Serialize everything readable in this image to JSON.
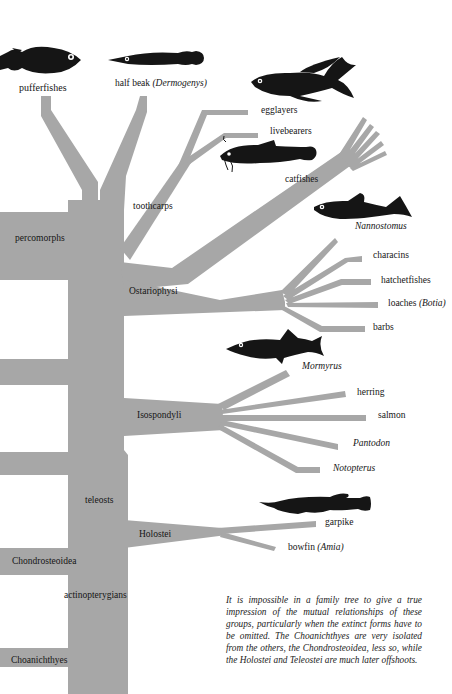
{
  "diagram": {
    "type": "phylogenetic-tree",
    "branch_color": "#a7a7a7",
    "fish_color": "#151515",
    "background": "#ffffff"
  },
  "labels": {
    "pufferfishes": "pufferfishes",
    "halfbeak": "half beak",
    "halfbeak_genus": "(Dermogenys)",
    "egglayers": "egglayers",
    "livebearers": "livebearers",
    "catfishes": "catfishes",
    "nannostomus": "Nannostomus",
    "toothcarps": "toothcarps",
    "percomorphs": "percomorphs",
    "characins": "characins",
    "hatchetfishes": "hatchetfishes",
    "ostariophysi": "Ostariophysi",
    "loaches": "loaches",
    "loaches_genus": "(Botia)",
    "barbs": "barbs",
    "mormyrus": "Mormyrus",
    "herring": "herring",
    "salmon": "salmon",
    "isospondyli": "Isospondyli",
    "pantodon": "Pantodon",
    "notopterus": "Notopterus",
    "teleosts": "teleosts",
    "garpike": "garpike",
    "holostei": "Holostei",
    "bowfin": "bowfin",
    "bowfin_genus": "(Amia)",
    "chondrosteoidea": "Chondrosteoidea",
    "actinopterygians": "actinopterygians",
    "choanichthyes": "Choanichthyes"
  },
  "fish_icons": [
    "pufferfish-icon",
    "halfbeak-icon",
    "egglayer-icon",
    "catfish-icon",
    "nannostomus-icon",
    "mormyrus-icon",
    "garpike-icon"
  ],
  "caption": "It is impossible in a family tree to give a true impression of the mutual relationships of these groups, particularly when the extinct forms have to be omitted. The Choanichthyes are very isolated from the others, the Chondrosteoidea, less so, while the Holostei and Teleostei are much later offshoots."
}
